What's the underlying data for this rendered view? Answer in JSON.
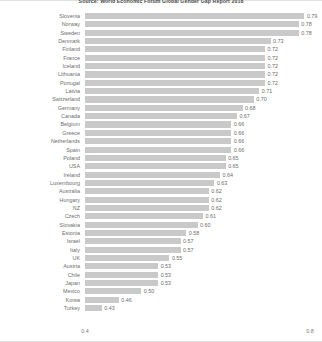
{
  "chart_data": {
    "type": "bar",
    "orientation": "horizontal",
    "title": "Source: World Economic Forum Global Gender Gap Report 2018",
    "xlabel": "",
    "ylabel": "",
    "xlim": [
      0.4,
      0.8
    ],
    "grid": false,
    "legend": null,
    "bar_color": "#c9c9c9",
    "xticks": [
      "0.4",
      "0.8"
    ],
    "xtick_values": [
      0.4,
      0.8
    ],
    "categories": [
      "Slovenia",
      "Norway",
      "Sweden",
      "Denmark",
      "Finland",
      "France",
      "Iceland",
      "Lithuania",
      "Portugal",
      "Latvia",
      "Switzerland",
      "Germany",
      "Canada",
      "Belgium",
      "Greece",
      "Netherlands",
      "Spain",
      "Poland",
      "USA",
      "Ireland",
      "Luxembourg",
      "Australia",
      "Hungary",
      "NZ",
      "Czech",
      "Slovakia",
      "Estonia",
      "Israel",
      "Italy",
      "UK",
      "Austria",
      "Chile",
      "Japan",
      "Mexico",
      "Korea",
      "Turkey"
    ],
    "values": [
      0.79,
      0.78,
      0.78,
      0.73,
      0.72,
      0.72,
      0.72,
      0.72,
      0.72,
      0.71,
      0.7,
      0.68,
      0.67,
      0.66,
      0.66,
      0.66,
      0.66,
      0.65,
      0.65,
      0.64,
      0.63,
      0.62,
      0.62,
      0.62,
      0.61,
      0.6,
      0.58,
      0.57,
      0.57,
      0.55,
      0.53,
      0.53,
      0.53,
      0.5,
      0.46,
      0.43
    ],
    "value_labels": [
      "0.79",
      "0.78",
      "0.78",
      "0.73",
      "0.72",
      "0.72",
      "0.72",
      "0.72",
      "0.72",
      "0.71",
      "0.70",
      "0.68",
      "0.67",
      "0.66",
      "0.66",
      "0.66",
      "0.66",
      "0.65",
      "0.65",
      "0.64",
      "0.63",
      "0.62",
      "0.62",
      "0.62",
      "0.61",
      "0.60",
      "0.58",
      "0.57",
      "0.57",
      "0.55",
      "0.53",
      "0.53",
      "0.53",
      "0.50",
      "0.46",
      "0.43"
    ]
  }
}
